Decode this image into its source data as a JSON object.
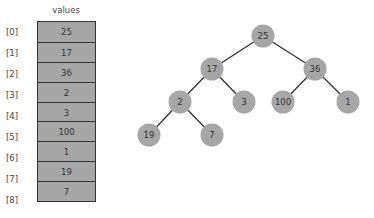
{
  "array": {
    "title": "values",
    "indices": [
      "[0]",
      "[1]",
      "[2]",
      "[3]",
      "[4]",
      "[5]",
      "[6]",
      "[7]",
      "[8]"
    ],
    "values": [
      "25",
      "17",
      "36",
      "2",
      "3",
      "100",
      "1",
      "19",
      "7"
    ]
  },
  "tree": {
    "nodes": [
      {
        "label": "25",
        "x": 263,
        "y": 36
      },
      {
        "label": "17",
        "x": 212,
        "y": 69
      },
      {
        "label": "36",
        "x": 315,
        "y": 69
      },
      {
        "label": "2",
        "x": 180,
        "y": 102
      },
      {
        "label": "3",
        "x": 244,
        "y": 102
      },
      {
        "label": "100",
        "x": 283,
        "y": 102
      },
      {
        "label": "1",
        "x": 348,
        "y": 102
      },
      {
        "label": "19",
        "x": 149,
        "y": 135
      },
      {
        "label": "7",
        "x": 212,
        "y": 135
      }
    ],
    "edges": [
      [
        0,
        1
      ],
      [
        0,
        2
      ],
      [
        1,
        3
      ],
      [
        1,
        4
      ],
      [
        2,
        5
      ],
      [
        2,
        6
      ],
      [
        3,
        7
      ],
      [
        3,
        8
      ]
    ]
  },
  "colors": {
    "cell_fill": "#a6a6a6",
    "node_fill": "#a6a6a6",
    "edge": "#333333",
    "border": "#333333"
  }
}
